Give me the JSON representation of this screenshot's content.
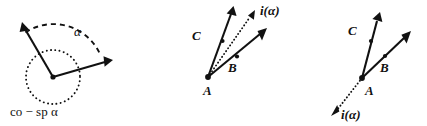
{
  "figure": {
    "background_color": "#ffffff",
    "ink_color": "#111111",
    "panels": [
      {
        "id": "panel-1",
        "name": "angle-alpha-with-cospan",
        "vertex": {
          "x": 53,
          "y": 77
        },
        "rays": [
          {
            "name": "ray-upper-left",
            "style": "solid",
            "tip": {
              "x": 22,
              "y": 24
            }
          },
          {
            "name": "ray-right",
            "style": "solid",
            "tip": {
              "x": 112,
              "y": 60
            }
          }
        ],
        "arc": {
          "name": "angle-arc-alpha",
          "style": "dashed",
          "radius": 50
        },
        "circle": {
          "name": "dotted-span-circle",
          "style": "dotted",
          "radius": 27
        },
        "labels": {
          "angle": "α",
          "caption": "co − sp α"
        }
      },
      {
        "id": "panel-2",
        "name": "rays-ABC-with-i-alpha-inside",
        "vertex_label": "A",
        "vertex": {
          "x": 208,
          "y": 77
        },
        "rays": [
          {
            "name": "ray-C",
            "style": "solid",
            "label": "C",
            "tip": {
              "x": 233,
              "y": 8
            }
          },
          {
            "name": "ray-B",
            "style": "solid",
            "label": "B",
            "tip": {
              "x": 266,
              "y": 29
            }
          },
          {
            "name": "ray-i-alpha",
            "style": "dotted",
            "label": "i(α)",
            "tip": {
              "x": 254,
              "y": 12
            }
          }
        ],
        "labels": {
          "A": "A",
          "B": "B",
          "C": "C",
          "i_alpha": "i(α)"
        }
      },
      {
        "id": "panel-3",
        "name": "rays-ABC-with-i-alpha-opposite",
        "vertex_label": "A",
        "vertex": {
          "x": 362,
          "y": 78
        },
        "rays": [
          {
            "name": "ray-C",
            "style": "solid",
            "label": "C",
            "tip": {
              "x": 379,
              "y": 14
            }
          },
          {
            "name": "ray-B",
            "style": "solid",
            "label": "B",
            "tip": {
              "x": 410,
              "y": 32
            }
          },
          {
            "name": "ray-i-alpha",
            "style": "dotted",
            "label": "i(α)",
            "tip": {
              "x": 330,
              "y": 115
            }
          }
        ],
        "labels": {
          "A": "A",
          "B": "B",
          "C": "C",
          "i_alpha": "i(α)"
        }
      }
    ]
  }
}
